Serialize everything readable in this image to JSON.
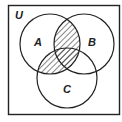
{
  "diagram": {
    "type": "venn",
    "universe_label": "U",
    "sets": [
      {
        "label": "A",
        "cx": 50,
        "cy": 44,
        "r": 30
      },
      {
        "label": "B",
        "cx": 84,
        "cy": 44,
        "r": 30
      },
      {
        "label": "C",
        "cx": 67,
        "cy": 78,
        "r": 30
      }
    ],
    "shaded_regions": [
      "A∩B",
      "A∩C"
    ],
    "colors": {
      "stroke": "#222222",
      "background": "#ffffff",
      "hatch": "#222222"
    }
  }
}
